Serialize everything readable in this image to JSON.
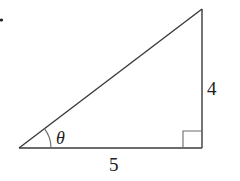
{
  "diagram": {
    "type": "right-triangle",
    "labels": {
      "angle": "θ",
      "base": "5",
      "height": "4"
    },
    "colors": {
      "stroke": "#3a3a3a",
      "text": "#222222",
      "background": "#ffffff"
    }
  }
}
